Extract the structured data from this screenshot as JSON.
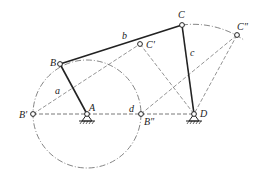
{
  "diagram": {
    "type": "four-bar linkage",
    "points": {
      "A": {
        "label": "A",
        "x": 87,
        "y": 114
      },
      "B": {
        "label": "B",
        "x": 60,
        "y": 64
      },
      "C": {
        "label": "C",
        "x": 182,
        "y": 25
      },
      "D": {
        "label": "D",
        "x": 194,
        "y": 114
      },
      "B1": {
        "label": "B'",
        "x": 33,
        "y": 114
      },
      "B2": {
        "label": "B\"",
        "x": 141,
        "y": 114
      },
      "C1": {
        "label": "C'",
        "x": 140,
        "y": 44
      },
      "C2": {
        "label": "C\"",
        "x": 237,
        "y": 35
      }
    },
    "links": {
      "a": "a",
      "b": "b",
      "c": "c",
      "d": "d"
    },
    "colors": {
      "line": "#222222",
      "construction": "#555555"
    }
  }
}
